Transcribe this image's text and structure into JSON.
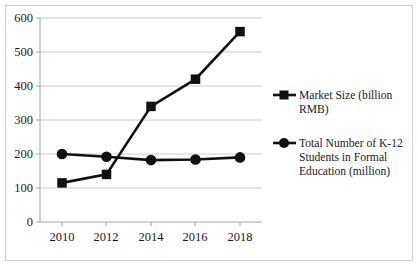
{
  "chart_data": {
    "type": "line",
    "title": "",
    "subtitle": "",
    "xlabel": "",
    "ylabel": "",
    "x": [
      2010,
      2012,
      2014,
      2016,
      2018
    ],
    "categories": [
      "2010",
      "2012",
      "2014",
      "2016",
      "2018"
    ],
    "series": [
      {
        "name": "Market Size (billion RMB)",
        "marker": "square",
        "color": "#111111",
        "values": [
          115,
          140,
          340,
          420,
          560
        ]
      },
      {
        "name": "Total Number of K-12 Students in Formal Education (million)",
        "marker": "circle",
        "color": "#111111",
        "values": [
          200,
          192,
          182,
          184,
          190
        ]
      }
    ],
    "ylim": [
      0,
      600
    ],
    "ytick_labels": [
      "0",
      "100",
      "200",
      "300",
      "400",
      "500",
      "600"
    ],
    "ytick_values": [
      0,
      100,
      200,
      300,
      400,
      500,
      600
    ],
    "xtick_labels": [
      "2010",
      "2012",
      "2014",
      "2016",
      "2018"
    ],
    "grid": "horizontal",
    "legend_position": "right",
    "legend": [
      {
        "marker": "square",
        "lines": [
          "Market Size (billion",
          "RMB)"
        ]
      },
      {
        "marker": "circle",
        "lines": [
          "Total Number of K-12",
          "Students in Formal",
          "Education (million)"
        ]
      }
    ]
  },
  "colors": {
    "series": "#111111",
    "gridline": "#bfbfbf",
    "axis": "#9a9a9a",
    "border": "#d0d0d0",
    "background": "#ffffff",
    "text": "#1a1a1a"
  }
}
